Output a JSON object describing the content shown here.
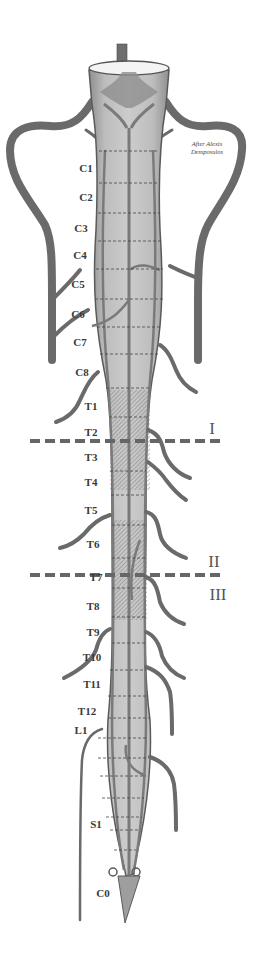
{
  "diagram": {
    "credit": {
      "line1": "After Alexis",
      "line2": "Demposulos"
    },
    "segments": [
      {
        "label": "C1",
        "y": 168
      },
      {
        "label": "C2",
        "y": 197
      },
      {
        "label": "C3",
        "y": 228
      },
      {
        "label": "C4",
        "y": 255
      },
      {
        "label": "C5",
        "y": 284
      },
      {
        "label": "C6",
        "y": 314
      },
      {
        "label": "C7",
        "y": 342
      },
      {
        "label": "C8",
        "y": 372
      },
      {
        "label": "T1",
        "y": 406
      },
      {
        "label": "T2",
        "y": 432
      },
      {
        "label": "T3",
        "y": 457
      },
      {
        "label": "T4",
        "y": 482
      },
      {
        "label": "T5",
        "y": 510
      },
      {
        "label": "T6",
        "y": 544
      },
      {
        "label": "T7",
        "y": 577
      },
      {
        "label": "T8",
        "y": 606
      },
      {
        "label": "T9",
        "y": 632
      },
      {
        "label": "T10",
        "y": 657
      },
      {
        "label": "T11",
        "y": 684
      },
      {
        "label": "T12",
        "y": 711
      },
      {
        "label": "L1",
        "y": 730
      },
      {
        "label": "S1",
        "y": 824
      },
      {
        "label": "C0",
        "y": 893
      }
    ],
    "zones": [
      {
        "label": "I",
        "y": 434
      },
      {
        "label": "II",
        "y": 561
      },
      {
        "label": "III",
        "y": 599
      }
    ],
    "dividers": [
      {
        "name": "divider-I",
        "y": 441
      },
      {
        "name": "divider-II-III",
        "y": 575
      }
    ],
    "colors": {
      "vessel": "#6e6e6e",
      "cord_fill": "#b9b9b9",
      "cord_outline": "#5a5a5a",
      "dashed_divider": "#666666",
      "hatch": "#8a8a8a"
    }
  }
}
